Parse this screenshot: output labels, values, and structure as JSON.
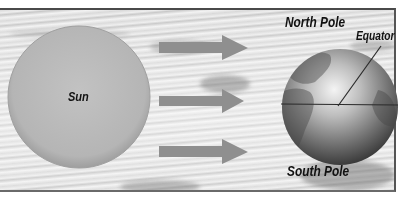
{
  "diagram": {
    "labels": {
      "sun": "Sun",
      "north_pole": "North Pole",
      "south_pole": "South Pole",
      "equator": "Equator"
    },
    "elements": {
      "sun": {
        "shape": "circle",
        "color": "#b8b8b8"
      },
      "earth": {
        "shape": "globe",
        "color": "#8a8a8a"
      },
      "arrows": [
        {
          "id": "arrow-top",
          "direction": "right",
          "color": "#8f8f8f"
        },
        {
          "id": "arrow-middle",
          "direction": "right",
          "color": "#8f8f8f"
        },
        {
          "id": "arrow-bottom",
          "direction": "right",
          "color": "#8f8f8f"
        }
      ],
      "equator_line": {
        "color": "#2a2a2a"
      },
      "background": "clouds (grayscale photo)"
    }
  }
}
